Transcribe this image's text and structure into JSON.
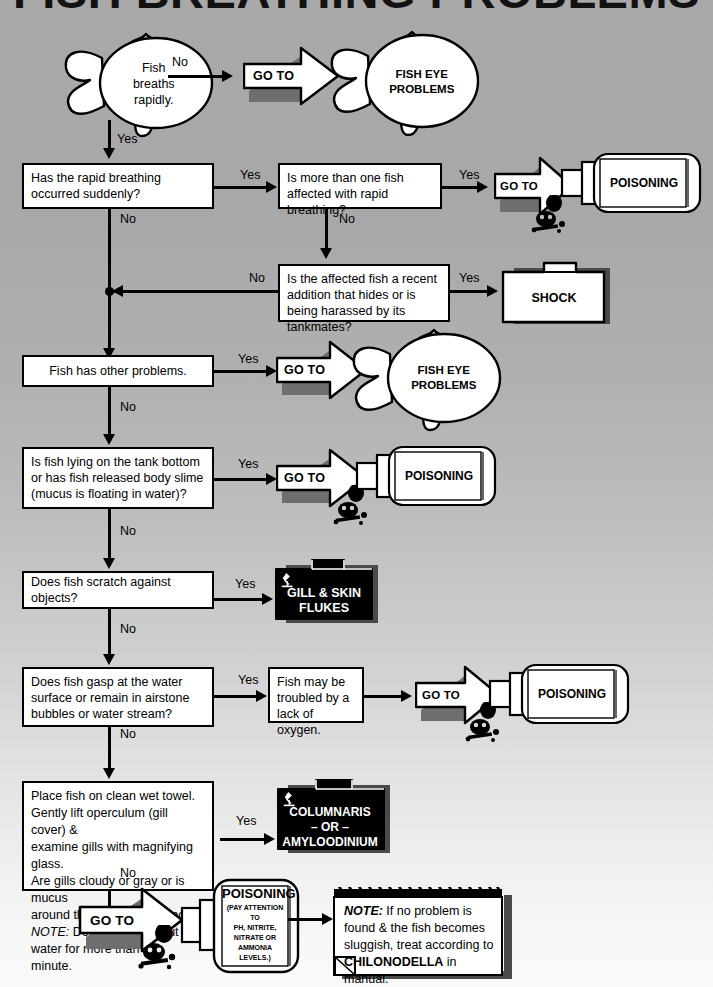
{
  "title": "FISH BREATHING PROBLEMS",
  "colors": {
    "background_top": "#a9a9a9",
    "background_bottom": "#fafafa",
    "line": "#000000",
    "box_fill": "#ffffff",
    "box_shadow": "#6e6e6e",
    "folder_black_fill": "#000000",
    "folder_black_text": "#ffffff"
  },
  "labels": {
    "yes": "Yes",
    "no": "No",
    "goto": "GO TO"
  },
  "nodes": {
    "start_fish": {
      "line1": "Fish",
      "line2": "breaths",
      "line3": "rapidly."
    },
    "fish_eye_1": {
      "line1": "FISH EYE",
      "line2": "PROBLEMS"
    },
    "fish_eye_2": {
      "line1": "FISH EYE",
      "line2": "PROBLEMS"
    },
    "q_sudden": {
      "text": "Has the rapid breathing occurred suddenly?"
    },
    "q_more_than_one": {
      "text": "Is more than one fish affected with rapid breathing?"
    },
    "q_recent_addition": {
      "text": "Is the affected fish a recent addition that hides or is being harassed by its tankmates?"
    },
    "shock": {
      "text": "SHOCK"
    },
    "q_other_problems": {
      "text": "Fish has other problems."
    },
    "q_lying_bottom": {
      "text": "Is fish lying on the tank bottom or has fish released body slime (mucus is floating in water)?"
    },
    "q_scratch": {
      "text": "Does fish scratch against objects?"
    },
    "flukes": {
      "line1": "GILL & SKIN",
      "line2": "FLUKES"
    },
    "q_gasp": {
      "text": "Does fish gasp at the water surface or remain in airstone bubbles or water stream?"
    },
    "lack_oxygen": {
      "text": "Fish may be troubled by a lack of oxygen."
    },
    "q_gills": {
      "line1": "Place fish on clean wet towel.",
      "line2": "Gently lift operculum (gill cover) &",
      "line3": "examine gills with magnifying glass.",
      "line4": "Are gills cloudy or gray or is mucus",
      "line5": "around the gill circumference?",
      "note_label": "NOTE:",
      "line6": " Don't leave fish out of",
      "line7": "water for more than one minute."
    },
    "columnaris": {
      "line1": "COLUMNARIS",
      "line2": "– OR –",
      "line3": "AMYLOODINIUM"
    },
    "poisoning_1": {
      "title": "POISONING"
    },
    "poisoning_2": {
      "title": "POISONING"
    },
    "poisoning_3": {
      "title": "POISONING"
    },
    "poisoning_4": {
      "title": "POISONING",
      "sub1": "(PAY ATTENTION TO",
      "sub2": "PH, NITRITE,",
      "sub3": "NITRATE OR",
      "sub4": "AMMONIA LEVELS.)"
    },
    "note": {
      "label": "NOTE:",
      "part1": " If no problem is found & the fish becomes sluggish, treat according to ",
      "bold": "CHILONODELLA",
      "part2": " in manual."
    }
  },
  "icons": {
    "microscope": "microscope-icon",
    "skull": "skull-and-crossbones-icon",
    "goto_arrow": "right-arrow-icon"
  },
  "edges": [
    {
      "from": "start_fish",
      "to": "fish_eye_1",
      "label": "No"
    },
    {
      "from": "start_fish",
      "to": "q_sudden",
      "label": "Yes"
    },
    {
      "from": "q_sudden",
      "to": "q_more_than_one",
      "label": "Yes"
    },
    {
      "from": "q_sudden",
      "to": "q_other_problems",
      "label": "No"
    },
    {
      "from": "q_more_than_one",
      "to": "poisoning_1",
      "label": "Yes"
    },
    {
      "from": "q_more_than_one",
      "to": "q_recent_addition",
      "label": "No"
    },
    {
      "from": "q_recent_addition",
      "to": "shock",
      "label": "Yes"
    },
    {
      "from": "q_recent_addition",
      "to": "q_other_problems",
      "label": "No"
    },
    {
      "from": "q_other_problems",
      "to": "fish_eye_2",
      "label": "Yes"
    },
    {
      "from": "q_other_problems",
      "to": "q_lying_bottom",
      "label": "No"
    },
    {
      "from": "q_lying_bottom",
      "to": "poisoning_2",
      "label": "Yes"
    },
    {
      "from": "q_lying_bottom",
      "to": "q_scratch",
      "label": "No"
    },
    {
      "from": "q_scratch",
      "to": "flukes",
      "label": "Yes"
    },
    {
      "from": "q_scratch",
      "to": "q_gasp",
      "label": "No"
    },
    {
      "from": "q_gasp",
      "to": "lack_oxygen",
      "label": "Yes"
    },
    {
      "from": "q_gasp",
      "to": "q_gills",
      "label": "No"
    },
    {
      "from": "lack_oxygen",
      "to": "poisoning_3",
      "label": ""
    },
    {
      "from": "q_gills",
      "to": "columnaris",
      "label": "Yes"
    },
    {
      "from": "q_gills",
      "to": "poisoning_4",
      "label": "No"
    },
    {
      "from": "poisoning_4",
      "to": "note",
      "label": ""
    }
  ]
}
